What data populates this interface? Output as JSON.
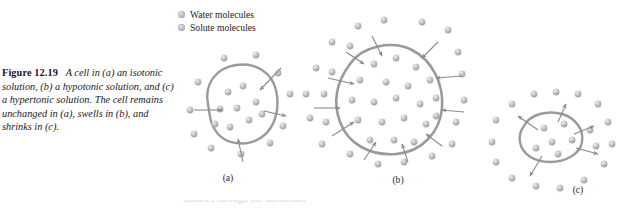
{
  "figure": {
    "number": "Figure 12.19",
    "caption": "A cell in (a) an isotonic solution, (b) a hypotonic solution, and (c) a hypertonic solution. The cell remains unchanged in (a), swells in (b), and shrinks in (c).",
    "clipped_text": "diffuses through the membrane"
  },
  "legend": {
    "items": [
      {
        "label": "Water molecules",
        "marker": "gray-sphere"
      },
      {
        "label": "Solute molecules",
        "marker": "gray-sphere"
      }
    ]
  },
  "panels": [
    {
      "id": "a",
      "label": "(a)",
      "condition": "isotonic solution",
      "result": "cell remains unchanged",
      "water_flow": "equal in and out",
      "cell_size": "normal"
    },
    {
      "id": "b",
      "label": "(b)",
      "condition": "hypotonic solution",
      "result": "cell swells",
      "water_flow": "net inward",
      "cell_size": "enlarged"
    },
    {
      "id": "c",
      "label": "(c)",
      "condition": "hypertonic solution",
      "result": "cell shrinks",
      "water_flow": "net outward",
      "cell_size": "shrunken"
    }
  ],
  "colors": {
    "membrane": "#9a9a9a",
    "molecule_light": "#e3e3e3",
    "molecule_mid": "#c2c2c2",
    "molecule_dark": "#9c9c9c",
    "arrow": "#8a8a8a",
    "text": "#1a1a1a",
    "background": "#ffffff"
  }
}
